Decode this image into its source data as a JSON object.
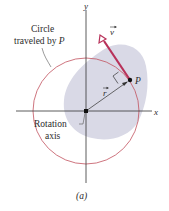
{
  "figure": {
    "caption": "(a)",
    "labels": {
      "circle_line1": "Circle",
      "circle_line2": "traveled by ",
      "circle_point": "P",
      "rotation_line1": "Rotation",
      "rotation_line2": "axis",
      "axis_x": "x",
      "axis_y": "y",
      "point": "P",
      "vector_v": "v",
      "vector_r": "r"
    },
    "colors": {
      "circle": "#c2525e",
      "velocity": "#b8325a",
      "blob": "#d9d9e6",
      "axes": "#333333",
      "radius": "#444444"
    }
  }
}
